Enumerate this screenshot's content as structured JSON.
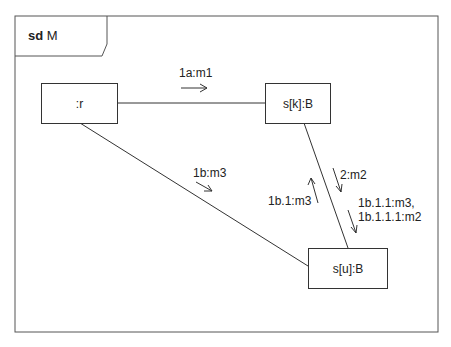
{
  "frame": {
    "keyword": "sd",
    "name": "M"
  },
  "lifelines": [
    {
      "id": "r",
      "label": ":r"
    },
    {
      "id": "sk",
      "label": "s[k]:B"
    },
    {
      "id": "su",
      "label": "s[u]:B"
    }
  ],
  "messages": [
    {
      "label": "1a:m1",
      "link": "r-sk",
      "direction": "r to s[k]"
    },
    {
      "label": "1b:m3",
      "link": "r-su",
      "direction": "r to s[u]"
    },
    {
      "label": "2:m2",
      "link": "sk-su",
      "direction": "s[k] to s[u]"
    },
    {
      "label": "1b.1:m3",
      "link": "sk-su",
      "direction": "s[u] to s[k]"
    },
    {
      "label_line1": "1b.1.1:m3,",
      "label_line2": "1b.1.1.1:m2",
      "link": "sk-su",
      "direction": "s[k] to s[u]"
    }
  ]
}
